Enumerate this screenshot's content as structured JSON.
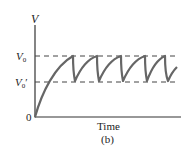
{
  "figure": {
    "y_axis_label": "V",
    "x_axis_label": "Time",
    "caption": "(b)",
    "origin_label": "0",
    "levels": [
      {
        "name": "V0",
        "base": "V",
        "sub": "0",
        "prime": ""
      },
      {
        "name": "V0'",
        "base": "V",
        "sub": "0",
        "prime": "′"
      }
    ]
  },
  "colors": {
    "axis": "#333333",
    "curve": "#666666",
    "dashed": "#444444",
    "text": "#222222"
  }
}
